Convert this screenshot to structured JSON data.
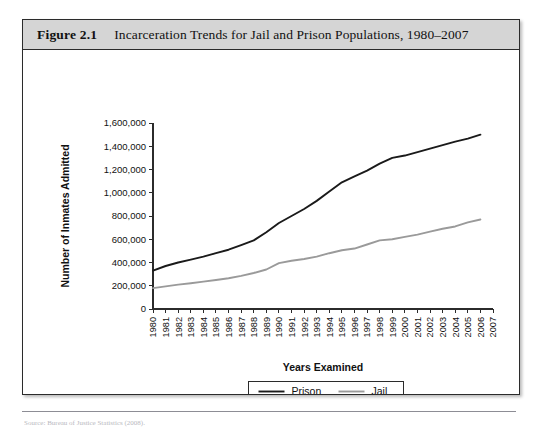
{
  "figure": {
    "label": "Figure 2.1",
    "title": "Incarceration Trends for Jail and Prison Populations, 1980–2007"
  },
  "source_note": {
    "text": "Source: Bureau of Justice Statistics (2008)."
  },
  "chart_data": {
    "type": "line",
    "title": "Incarceration Trends for Jail and Prison Populations, 1980–2007",
    "xlabel": "Years Examined",
    "ylabel": "Number of Inmates Admitted",
    "grid": false,
    "legend_position": "bottom-center",
    "ylim": [
      0,
      1600000
    ],
    "ytick_values": [
      0,
      200000,
      400000,
      600000,
      800000,
      1000000,
      1200000,
      1400000,
      1600000
    ],
    "ytick_labels": [
      "0",
      "200,000",
      "400,000",
      "600,000",
      "800,000",
      "1,000,000",
      "1,200,000",
      "1,400,000",
      "1,600,000"
    ],
    "categories": [
      "1980",
      "1981",
      "1982",
      "1983",
      "1984",
      "1985",
      "1986",
      "1987",
      "1988",
      "1989",
      "1990",
      "1991",
      "1992",
      "1993",
      "1994",
      "1995",
      "1996",
      "1997",
      "1998",
      "1999",
      "2000",
      "2001",
      "2002",
      "2003",
      "2004",
      "2005",
      "2006",
      "2007"
    ],
    "series": [
      {
        "name": "Prison",
        "color": "#1a1a1a",
        "width": 1.9,
        "values": [
          330000,
          370000,
          400000,
          425000,
          450000,
          480000,
          510000,
          550000,
          590000,
          660000,
          740000,
          800000,
          860000,
          930000,
          1010000,
          1090000,
          1140000,
          1190000,
          1250000,
          1300000,
          1320000,
          1350000,
          1380000,
          1410000,
          1440000,
          1465000,
          1500000,
          null
        ]
      },
      {
        "name": "Jail",
        "color": "#9a9a9a",
        "width": 1.9,
        "values": [
          180000,
          195000,
          210000,
          222000,
          235000,
          250000,
          265000,
          285000,
          310000,
          340000,
          395000,
          415000,
          430000,
          450000,
          480000,
          505000,
          520000,
          555000,
          590000,
          600000,
          620000,
          640000,
          665000,
          690000,
          710000,
          745000,
          770000,
          null
        ]
      }
    ],
    "legend": [
      {
        "label": "Prison",
        "color": "#1a1a1a"
      },
      {
        "label": "Jail",
        "color": "#9a9a9a"
      }
    ]
  }
}
